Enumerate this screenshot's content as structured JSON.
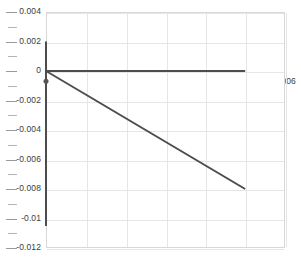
{
  "chart_data": {
    "type": "line",
    "title": "",
    "subtitle": "",
    "xlabel": "",
    "ylabel": "",
    "xlim": [
      0,
      0.006
    ],
    "ylim": [
      -0.012,
      0.004
    ],
    "grid": true,
    "legend": "none",
    "xticks": [
      0.001,
      0.002,
      0.003,
      0.004,
      0.005,
      0.006
    ],
    "xtick_labels": [
      "0.001",
      "0.002",
      "0.003",
      "0.004",
      "0.005",
      "0.006"
    ],
    "yticks": [
      0.004,
      0.002,
      0,
      -0.002,
      -0.004,
      -0.006,
      -0.008,
      -0.01,
      -0.012
    ],
    "ytick_labels": [
      "0.004",
      "0.002",
      "0",
      "-0.002",
      "-0.004",
      "-0.006",
      "-0.008",
      "-0.01",
      "-0.012"
    ],
    "y_minor_tick_count_between": 1,
    "series": [
      {
        "name": "vertical-segment",
        "color": "#4d4d4d",
        "linewidth": 2.0,
        "x": [
          0,
          0
        ],
        "y": [
          0.002,
          -0.0105
        ]
      },
      {
        "name": "horizontal-segment",
        "color": "#4d4d4d",
        "linewidth": 2.0,
        "x": [
          0,
          0.005
        ],
        "y": [
          0,
          0
        ]
      },
      {
        "name": "descending-segment",
        "color": "#4d4d4d",
        "linewidth": 2.0,
        "x": [
          0,
          0.005
        ],
        "y": [
          0,
          -0.008
        ]
      }
    ],
    "markers": [
      {
        "name": "origin-marker",
        "color": "#555555",
        "x": 0,
        "y": -0.0007,
        "size": 5
      }
    ]
  },
  "colors": {
    "background": "#ffffff",
    "frame": "#d8d8d8",
    "gridline": "#e6e6e6",
    "tick_text": "#3c3c3c",
    "data_line": "#4d4d4d"
  }
}
